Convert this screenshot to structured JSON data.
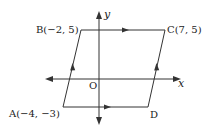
{
  "figure": {
    "type": "parallelogram-on-coordinate-plane",
    "colors": {
      "stroke": "#333333",
      "text": "#222222",
      "background": "#ffffff"
    },
    "axes": {
      "x_label": "x",
      "y_label": "y",
      "origin_label": "O"
    },
    "vertices": [
      {
        "name": "A",
        "label": "A(−4, −3)",
        "coords": [
          -4,
          -3
        ]
      },
      {
        "name": "B",
        "label": "B(−2, 5)",
        "coords": [
          -2,
          5
        ]
      },
      {
        "name": "C",
        "label": "C(7, 5)",
        "coords": [
          7,
          5
        ]
      },
      {
        "name": "D",
        "label": "D",
        "coords": null
      }
    ],
    "edges": [
      {
        "from": "A",
        "to": "B",
        "parallel_mark": "single-arrow"
      },
      {
        "from": "B",
        "to": "C",
        "parallel_mark": "single-arrow"
      },
      {
        "from": "D",
        "to": "C",
        "parallel_mark": "single-arrow"
      },
      {
        "from": "A",
        "to": "D",
        "parallel_mark": "single-arrow"
      }
    ]
  }
}
